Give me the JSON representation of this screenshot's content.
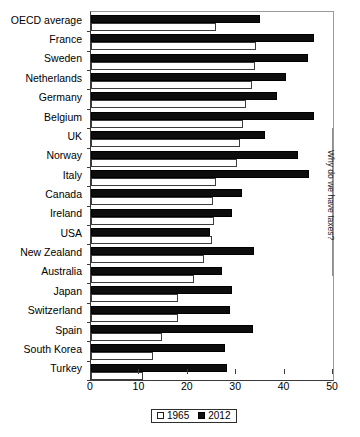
{
  "side_caption": "Why do we have taxes?",
  "legend": {
    "entries": [
      {
        "label": "1965",
        "style": "open"
      },
      {
        "label": "2012",
        "style": "filled"
      }
    ]
  },
  "axis": {
    "xticklabels": [
      "0",
      "10",
      "20",
      "30",
      "40",
      "50"
    ]
  },
  "chart_data": {
    "type": "bar",
    "orientation": "horizontal",
    "title": "",
    "xlabel": "",
    "ylabel": "",
    "xlim": [
      0,
      50
    ],
    "xticks": [
      0,
      10,
      20,
      30,
      40,
      50
    ],
    "grid": false,
    "legend_position": "bottom-center",
    "categories": [
      "OECD average",
      "France",
      "Sweden",
      "Netherlands",
      "Germany",
      "Belgium",
      "UK",
      "Norway",
      "Italy",
      "Canada",
      "Ireland",
      "USA",
      "New Zealand",
      "Australia",
      "Japan",
      "Switzerland",
      "Spain",
      "South Korea",
      "Turkey"
    ],
    "series": [
      {
        "name": "1965",
        "values": [
          25.8,
          34.0,
          33.9,
          33.3,
          32.0,
          31.4,
          30.8,
          30.2,
          25.8,
          25.2,
          25.4,
          25.0,
          23.4,
          21.3,
          18.0,
          18.0,
          14.7,
          12.8,
          10.8
        ]
      },
      {
        "name": "2012",
        "values": [
          34.9,
          46.1,
          44.9,
          40.3,
          38.4,
          46.0,
          36.0,
          42.8,
          45.0,
          31.2,
          29.1,
          24.6,
          33.7,
          27.1,
          29.1,
          28.7,
          33.4,
          27.7,
          28.1
        ]
      }
    ]
  }
}
